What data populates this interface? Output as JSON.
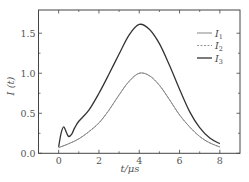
{
  "chart_data": {
    "type": "line",
    "title": "",
    "xlabel": "t/μs",
    "ylabel": "I (t)",
    "xlim": [
      -1,
      9
    ],
    "ylim": [
      0,
      1.79
    ],
    "xticks": [
      0,
      2,
      4,
      6,
      8
    ],
    "xtick_labels": [
      "0",
      "2",
      "4",
      "6",
      "8"
    ],
    "xminor": [
      1,
      3,
      5,
      7
    ],
    "yticks": [
      0.0,
      0.5,
      1.0,
      1.5
    ],
    "ytick_labels": [
      "0.0",
      "0.5",
      "1.0",
      "1.5"
    ],
    "yminor": [
      0.25,
      0.75,
      1.25
    ],
    "grid": false,
    "legend_position": "upper right",
    "series": [
      {
        "name": "I1",
        "label_base": "I",
        "label_sub": "1",
        "style": "solid",
        "color": "#777777",
        "width": 0.9,
        "x": [
          0,
          0.5,
          1,
          1.5,
          2,
          2.5,
          3,
          3.5,
          4,
          4.5,
          5,
          5.5,
          6,
          6.5,
          7,
          7.5,
          8
        ],
        "y": [
          0.07,
          0.12,
          0.18,
          0.27,
          0.38,
          0.54,
          0.73,
          0.9,
          1.0,
          0.97,
          0.85,
          0.67,
          0.48,
          0.33,
          0.21,
          0.13,
          0.08
        ]
      },
      {
        "name": "I2",
        "label_base": "I",
        "label_sub": "2",
        "style": "dashed",
        "color": "#888888",
        "width": 0.9,
        "x": [
          0,
          0.5,
          1,
          1.5,
          2,
          2.5,
          3,
          3.5,
          4,
          4.5,
          5,
          5.5,
          6,
          6.5,
          7,
          7.5,
          8
        ],
        "y": [
          0.07,
          0.12,
          0.18,
          0.27,
          0.38,
          0.54,
          0.73,
          0.9,
          1.0,
          0.97,
          0.85,
          0.67,
          0.48,
          0.33,
          0.21,
          0.13,
          0.08
        ]
      },
      {
        "name": "I3",
        "label_base": "I",
        "label_sub": "3",
        "style": "solid",
        "color": "#333333",
        "width": 1.3,
        "x": [
          0,
          0.12,
          0.25,
          0.4,
          0.5,
          0.65,
          0.8,
          1,
          1.5,
          2,
          2.5,
          3,
          3.5,
          4,
          4.5,
          5,
          5.5,
          6,
          6.5,
          7,
          7.5,
          8
        ],
        "y": [
          0.08,
          0.25,
          0.33,
          0.25,
          0.21,
          0.24,
          0.32,
          0.4,
          0.54,
          0.75,
          0.99,
          1.24,
          1.48,
          1.61,
          1.55,
          1.37,
          1.1,
          0.8,
          0.52,
          0.32,
          0.19,
          0.12
        ]
      }
    ]
  }
}
